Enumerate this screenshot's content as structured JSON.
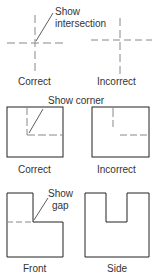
{
  "figure": {
    "panels": [
      {
        "id": "intersection",
        "callout": [
          "Show",
          "intersection"
        ],
        "left_label": "Correct",
        "right_label": "Incorrect"
      },
      {
        "id": "corner",
        "callout": [
          "Show corner"
        ],
        "left_label": "Correct",
        "right_label": "Incorrect"
      },
      {
        "id": "gap",
        "callout": [
          "Show",
          "gap"
        ],
        "left_label": "Front",
        "right_label": "Side"
      }
    ],
    "colors": {
      "solid_line": "#222222",
      "hidden_line": "#888888",
      "text": "#333333"
    }
  }
}
